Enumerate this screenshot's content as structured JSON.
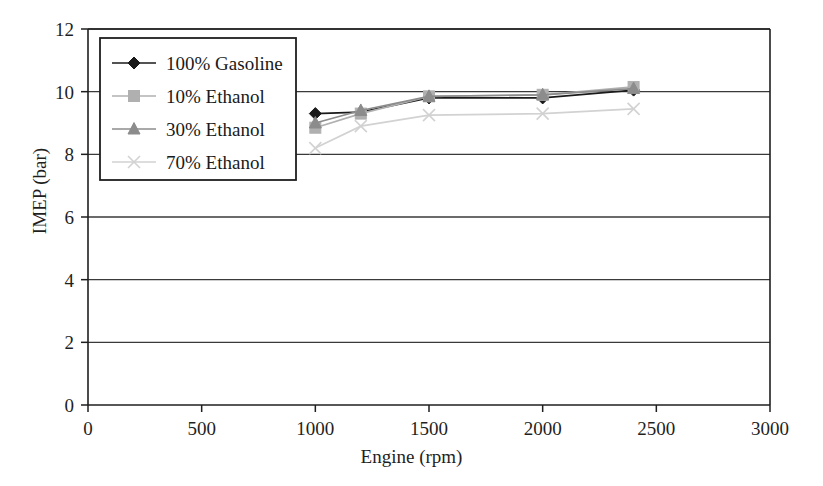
{
  "chart_data": {
    "type": "line",
    "title": "",
    "xlabel": "Engine (rpm)",
    "ylabel": "IMEP (bar)",
    "xlim": [
      0,
      3000
    ],
    "ylim": [
      0,
      12
    ],
    "xticks": [
      0,
      500,
      1000,
      1500,
      2000,
      2500,
      3000
    ],
    "yticks": [
      0,
      2,
      4,
      6,
      8,
      10,
      12
    ],
    "xtick_labels": [
      "0",
      "500",
      "1000",
      "1500",
      "2000",
      "2500",
      "3000"
    ],
    "ytick_labels": [
      "0",
      "2",
      "4",
      "6",
      "8",
      "10",
      "12"
    ],
    "grid": "horizontal",
    "legend_position": "upper-left",
    "x": [
      1000,
      1200,
      1500,
      2000,
      2400
    ],
    "series": [
      {
        "name": "100% Gasoline",
        "marker": "diamond",
        "color": "#1a1a1a",
        "values": [
          9.3,
          9.35,
          9.8,
          9.8,
          10.05
        ]
      },
      {
        "name": "10% Ethanol",
        "marker": "square",
        "color": "#b0b0b0",
        "values": [
          8.85,
          9.3,
          9.85,
          9.9,
          10.15
        ]
      },
      {
        "name": "30% Ethanol",
        "marker": "triangle",
        "color": "#8c8c8c",
        "values": [
          9.0,
          9.4,
          9.85,
          9.9,
          10.1
        ]
      },
      {
        "name": "70% Ethanol",
        "marker": "x",
        "color": "#d2d2d2",
        "values": [
          8.2,
          8.9,
          9.25,
          9.3,
          9.45
        ]
      }
    ]
  },
  "legend": {
    "items": [
      {
        "label": "100% Gasoline"
      },
      {
        "label": "10% Ethanol"
      },
      {
        "label": "30% Ethanol"
      },
      {
        "label": "70% Ethanol"
      }
    ]
  },
  "axes": {
    "x_title": "Engine (rpm)",
    "y_title": "IMEP (bar)"
  },
  "colors": {
    "axis": "#1f1f1f",
    "grid": "#3a3a3a",
    "background": "#ffffff",
    "gasoline": "#1a1a1a",
    "ethanol10": "#b0b0b0",
    "ethanol30": "#8c8c8c",
    "ethanol70": "#d2d2d2"
  }
}
